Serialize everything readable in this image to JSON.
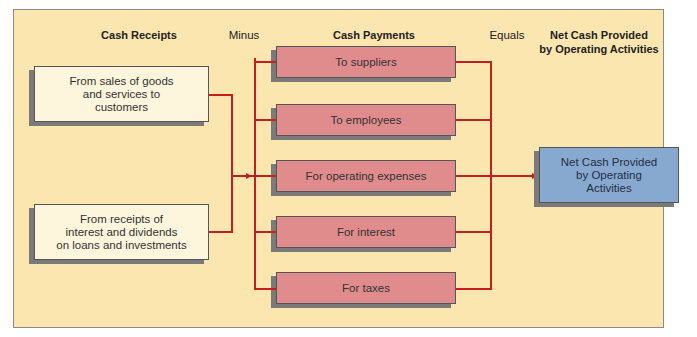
{
  "headers": {
    "cash_receipts": "Cash Receipts",
    "minus": "Minus",
    "cash_payments": "Cash Payments",
    "equals": "Equals",
    "net_cash_line1": "Net Cash Provided",
    "net_cash_line2": "by Operating Activities"
  },
  "receipts": [
    {
      "line1": "From sales of goods",
      "line2": "and services to",
      "line3": "customers"
    },
    {
      "line1": "From receipts of",
      "line2": "interest and dividends",
      "line3": "on loans and investments"
    }
  ],
  "payments": [
    {
      "label": "To suppliers"
    },
    {
      "label": "To employees"
    },
    {
      "label": "For operating expenses"
    },
    {
      "label": "For interest"
    },
    {
      "label": "For taxes"
    }
  ],
  "result": {
    "line1": "Net Cash Provided",
    "line2": "by Operating",
    "line3": "Activities"
  },
  "colors": {
    "background": "#fbe6b0",
    "receipt_box": "#fdf5dc",
    "payment_box": "#e08c8c",
    "result_box": "#88a9cf",
    "connector": "#c41e1e"
  }
}
